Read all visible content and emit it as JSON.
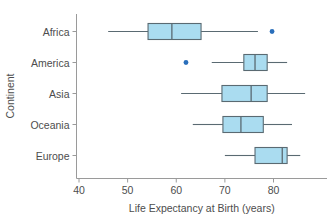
{
  "chart_data": {
    "type": "box",
    "title": "",
    "xlabel": "Life Expectancy at Birth (years)",
    "ylabel": "Continent",
    "xlim": [
      38,
      90
    ],
    "xticks": [
      40,
      50,
      60,
      70,
      80
    ],
    "xtick_labels": [
      "40",
      "50",
      "60",
      "70",
      "80"
    ],
    "categories": [
      "Africa",
      "America",
      "Asia",
      "Oceania",
      "Europe"
    ],
    "orientation": "horizontal",
    "grid": false,
    "legend": "none",
    "box_fill_color": "#aadcf0",
    "box_edge_color": "#5a6a72",
    "whisker_color": "#5a6a72",
    "outlier_color": "#2a6fbb",
    "axis_color": "#9a9a9a",
    "boxes": [
      {
        "category": "Africa",
        "whisker_low": 46.0,
        "q1": 54.2,
        "median": 59.1,
        "q3": 65.1,
        "whisker_high": 76.8,
        "outliers": [
          79.7
        ]
      },
      {
        "category": "America",
        "whisker_low": 67.3,
        "q1": 73.9,
        "median": 76.2,
        "q3": 78.7,
        "whisker_high": 82.8,
        "outliers": [
          62.0
        ]
      },
      {
        "category": "Asia",
        "whisker_low": 61.0,
        "q1": 69.4,
        "median": 75.4,
        "q3": 78.7,
        "whisker_high": 86.5,
        "outliers": []
      },
      {
        "category": "Oceania",
        "whisker_low": 63.4,
        "q1": 69.6,
        "median": 73.3,
        "q3": 77.9,
        "whisker_high": 83.8,
        "outliers": []
      },
      {
        "category": "Europe",
        "whisker_low": 70.0,
        "q1": 76.2,
        "median": 81.8,
        "q3": 82.8,
        "whisker_high": 85.5,
        "outliers": []
      }
    ]
  },
  "axes": {
    "x_title": "Life Expectancy at Birth (years)",
    "y_title": "Continent"
  }
}
